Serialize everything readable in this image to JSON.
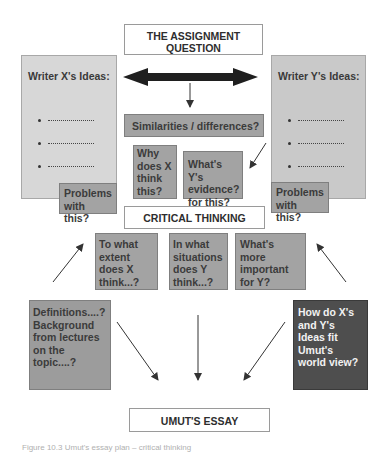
{
  "diagram": {
    "assignment_question": "THE ASSIGNMENT QUESTION",
    "writer_x": {
      "title": "Writer X's Ideas:",
      "bullets": [
        "..................",
        "..................",
        ".................."
      ]
    },
    "writer_y": {
      "title": "Writer Y's Ideas:",
      "bullets": [
        "..................",
        "..................",
        ".................."
      ]
    },
    "similarities": "Similarities / differences?",
    "why_does_x": "Why does X think this?",
    "whats_y_evidence": "What's Y's evidence? for this?",
    "problems_left": "Problems with this?",
    "problems_right": "Problems with this?",
    "critical_thinking": "CRITICAL THINKING",
    "to_what_extent": "To what extent does X think...?",
    "in_what_situations": "In what situations does Y think...?",
    "whats_more_important": "What's more important for Y?",
    "definitions": "Definitions....? Background from lectures on the topic....?",
    "how_do_ideas_fit": "How do X's and Y's Ideas fit Umut's world view?",
    "umuts_essay": "UMUT'S ESSAY",
    "caption_partial": "Figure 10.3  Umut's essay plan – critical thinking"
  },
  "colors": {
    "light_box": "#d7d7d7",
    "mid_box": "#a3a3a3",
    "dark_box": "#4e4e4e",
    "white_box": "#ffffff",
    "arrow": "#333333"
  }
}
